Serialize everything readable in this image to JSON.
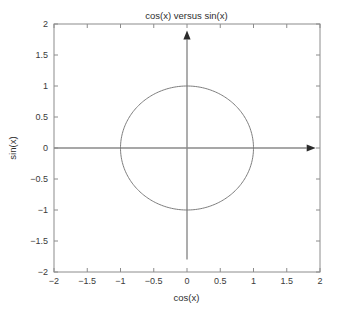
{
  "chart_data": {
    "type": "line",
    "title": "cos(x) versus sin(x)",
    "xlabel": "cos(x)",
    "ylabel": "sin(x)",
    "xlim": [
      -2,
      2
    ],
    "ylim": [
      -2,
      2
    ],
    "xticks": [
      "-2",
      "-1.5",
      "-1",
      "-0.5",
      "0",
      "0.5",
      "1",
      "1.5",
      "2"
    ],
    "xtick_values": [
      -2,
      -1.5,
      -1,
      -0.5,
      0,
      0.5,
      1,
      1.5,
      2
    ],
    "yticks": [
      "2",
      "1.5",
      "1",
      "0.5",
      "0",
      "-0.5",
      "-1",
      "-1.5",
      "-2"
    ],
    "ytick_values": [
      2,
      1.5,
      1,
      0.5,
      0,
      -0.5,
      -1,
      -1.5,
      -2
    ],
    "grid": false,
    "legend": false,
    "box": true,
    "series": [
      {
        "name": "unit circle",
        "description": "parametric curve x = cos(t), y = sin(t) for t in [0, 2*pi]",
        "x": [
          1,
          0.966,
          0.866,
          0.707,
          0.5,
          0.259,
          0,
          -0.259,
          -0.5,
          -0.707,
          -0.866,
          -0.966,
          -1,
          -0.966,
          -0.866,
          -0.707,
          -0.5,
          -0.259,
          0,
          0.259,
          0.5,
          0.707,
          0.866,
          0.966,
          1
        ],
        "y": [
          0,
          0.259,
          0.5,
          0.707,
          0.866,
          0.966,
          1,
          0.966,
          0.866,
          0.707,
          0.5,
          0.259,
          0,
          -0.259,
          -0.5,
          -0.707,
          -0.866,
          -0.966,
          -1,
          -0.966,
          -0.866,
          -0.707,
          -0.5,
          -0.259,
          0
        ]
      }
    ],
    "annotations": [
      {
        "name": "x-axis-arrow",
        "from": [
          -2,
          0
        ],
        "to": [
          1.8,
          0
        ],
        "style": "arrow-right"
      },
      {
        "name": "y-axis-arrow",
        "from": [
          0,
          -1.8
        ],
        "to": [
          0,
          1.75
        ],
        "style": "arrow-up"
      }
    ],
    "colors": {
      "curve": "#7d7d7d",
      "box": "#8c8c8c",
      "arrow": "#2b2b2b",
      "text": "#2e2e2e",
      "background": "#ffffff"
    }
  }
}
